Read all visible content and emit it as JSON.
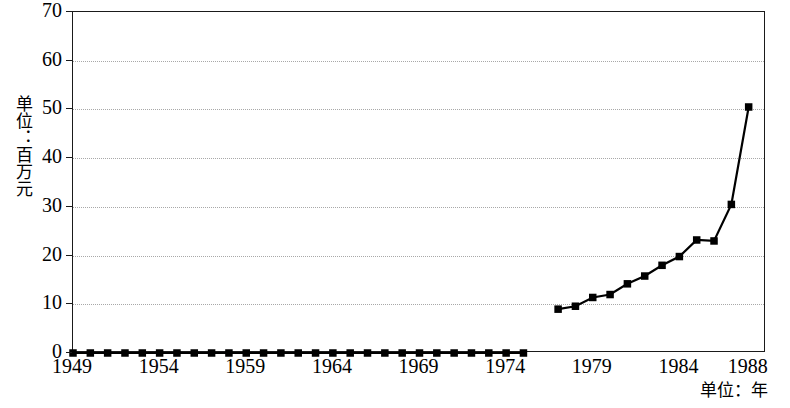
{
  "chart_data": {
    "type": "line",
    "title": "",
    "subtitle": "",
    "xlabel": "单位：年",
    "ylabel": "单位：百万元",
    "xlim": [
      1949,
      1989
    ],
    "ylim": [
      0,
      70
    ],
    "grid": true,
    "legend": null,
    "marker": "square",
    "line_color": "#000000",
    "marker_color": "#000000",
    "x_tick_labels": [
      "1949",
      "1954",
      "1959",
      "1964",
      "1969",
      "1974",
      "1979",
      "1984",
      "1988"
    ],
    "x_tick_values": [
      1949,
      1954,
      1959,
      1964,
      1969,
      1974,
      1979,
      1984,
      1988
    ],
    "y_tick_labels": [
      "0",
      "10",
      "20",
      "30",
      "40",
      "50",
      "60",
      "70"
    ],
    "y_tick_values": [
      0,
      10,
      20,
      30,
      40,
      50,
      60,
      70
    ],
    "x": [
      1949,
      1950,
      1951,
      1952,
      1953,
      1954,
      1955,
      1956,
      1957,
      1958,
      1959,
      1960,
      1961,
      1962,
      1963,
      1964,
      1965,
      1966,
      1967,
      1968,
      1969,
      1970,
      1971,
      1972,
      1973,
      1974,
      1975,
      1977,
      1978,
      1979,
      1980,
      1981,
      1982,
      1983,
      1984,
      1985,
      1986,
      1987,
      1988
    ],
    "values": [
      0,
      0,
      0,
      0,
      0,
      0,
      0,
      0,
      0,
      0,
      0,
      0,
      0,
      0,
      0,
      0,
      0,
      0,
      0,
      0,
      0,
      0,
      0,
      0,
      0,
      0,
      0,
      9.0,
      9.6,
      11.4,
      12.0,
      14.2,
      15.8,
      18.0,
      19.8,
      23.2,
      23.0,
      30.5,
      50.5
    ],
    "segments": [
      {
        "name": "flat-segment",
        "x": [
          1949,
          1950,
          1951,
          1952,
          1953,
          1954,
          1955,
          1956,
          1957,
          1958,
          1959,
          1960,
          1961,
          1962,
          1963,
          1964,
          1965,
          1966,
          1967,
          1968,
          1969,
          1970,
          1971,
          1972,
          1973,
          1974,
          1975
        ],
        "values": [
          0,
          0,
          0,
          0,
          0,
          0,
          0,
          0,
          0,
          0,
          0,
          0,
          0,
          0,
          0,
          0,
          0,
          0,
          0,
          0,
          0,
          0,
          0,
          0,
          0,
          0,
          0
        ]
      },
      {
        "name": "rising-segment",
        "x": [
          1977,
          1978,
          1979,
          1980,
          1981,
          1982,
          1983,
          1984,
          1985,
          1986,
          1987,
          1988
        ],
        "values": [
          9.0,
          9.6,
          11.4,
          12.0,
          14.2,
          15.8,
          18.0,
          19.8,
          23.2,
          23.0,
          30.5,
          50.5
        ]
      }
    ]
  }
}
